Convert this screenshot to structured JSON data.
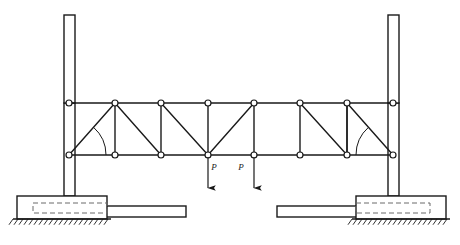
{
  "figure": {
    "kind": "structural-truss-diagram",
    "width": 460,
    "height": 245,
    "background_color": "#ffffff",
    "line_color": "#1a1a1a",
    "caption": ""
  },
  "chart_data": {
    "type": "diagram",
    "title": "",
    "subtitle": "",
    "xlabel": "",
    "ylabel": "",
    "coordinate_note": "Coordinates are in screenshot pixel space, origin at top-left of the 460x245 image.",
    "truss": {
      "top_chord_y": 103,
      "bottom_chord_y": 155,
      "panel_count": 7,
      "joint_radius": 3.0,
      "joint_style": "open-circle",
      "top_joints_x": [
        69,
        115,
        161,
        208,
        254,
        300,
        347,
        393
      ],
      "bottom_joints_x": [
        69,
        115,
        161,
        208,
        254,
        300,
        347,
        393
      ],
      "top_joint_labels": [
        "T1",
        "T2",
        "T3",
        "T4",
        "T5",
        "T6",
        "T7",
        "T8"
      ],
      "bottom_joint_labels": [
        "B1",
        "B2",
        "B3",
        "B4",
        "B5",
        "B6",
        "B7",
        "B8"
      ],
      "verticals": [
        {
          "from": "T2",
          "to": "B2"
        },
        {
          "from": "T3",
          "to": "B3"
        },
        {
          "from": "T4",
          "to": "B4"
        },
        {
          "from": "T5",
          "to": "B5"
        },
        {
          "from": "T6",
          "to": "B6"
        },
        {
          "from": "T7",
          "to": "B7"
        }
      ],
      "diagonals": [
        {
          "from": "B1",
          "to": "T2"
        },
        {
          "from": "T2",
          "to": "B3"
        },
        {
          "from": "T3",
          "to": "B4"
        },
        {
          "from": "B4",
          "to": "T5"
        },
        {
          "from": "T6",
          "to": "B7"
        },
        {
          "from": "B7",
          "to": "T7"
        },
        {
          "from": "T7",
          "to": "B8"
        }
      ],
      "end_angle_arcs": [
        {
          "vertex": "B1",
          "side": "left",
          "radius": 37,
          "note": "angle between bottom chord and end diagonal"
        },
        {
          "vertex": "B8",
          "side": "right",
          "radius": 37,
          "note": "angle between bottom chord and end diagonal"
        }
      ]
    },
    "loads": [
      {
        "label": "P",
        "joint": "B4",
        "x": 208,
        "direction": "down",
        "tail_y": 157,
        "head_y": 188,
        "label_x": 214,
        "label_y": 170
      },
      {
        "label": "P",
        "joint": "B5",
        "x": 254,
        "direction": "down",
        "tail_y": 157,
        "head_y": 188,
        "label_x": 241,
        "label_y": 170
      }
    ],
    "columns": [
      {
        "name": "left-column",
        "x": 64,
        "y": 15,
        "width": 11,
        "height": 88
      },
      {
        "name": "right-column",
        "x": 388,
        "y": 15,
        "width": 11,
        "height": 88
      }
    ],
    "column_extensions": [
      {
        "name": "left-column-lower",
        "x": 64,
        "y": 103,
        "width": 11,
        "height": 93
      },
      {
        "name": "right-column-lower",
        "x": 388,
        "y": 103,
        "width": 11,
        "height": 93
      }
    ],
    "supports": [
      {
        "name": "left-support",
        "block": {
          "x": 17,
          "y": 196,
          "width": 90,
          "height": 23
        },
        "dashed_insert": {
          "x": 33,
          "y": 203,
          "width": 74,
          "height": 10
        },
        "arm": {
          "x": 103,
          "y": 206,
          "width": 83,
          "height": 11
        },
        "ground_line": {
          "x1": 13,
          "x2": 111,
          "y": 219
        },
        "hatch": {
          "x1": 13,
          "x2": 111,
          "y": 219,
          "length": 7,
          "spacing": 5,
          "angle_deg": 55
        }
      },
      {
        "name": "right-support",
        "block": {
          "x": 356,
          "y": 196,
          "width": 90,
          "height": 23
        },
        "dashed_insert": {
          "x": 356,
          "y": 203,
          "width": 74,
          "height": 10
        },
        "arm": {
          "x": 277,
          "y": 206,
          "width": 83,
          "height": 11
        },
        "ground_line": {
          "x1": 352,
          "x2": 450,
          "y": 219
        },
        "hatch": {
          "x1": 352,
          "x2": 450,
          "y": 219,
          "length": 7,
          "spacing": 5,
          "angle_deg": 55
        }
      }
    ],
    "legend": [],
    "annotations": [
      {
        "text": "P",
        "x": 214,
        "y": 170
      },
      {
        "text": "P",
        "x": 241,
        "y": 170
      }
    ]
  }
}
